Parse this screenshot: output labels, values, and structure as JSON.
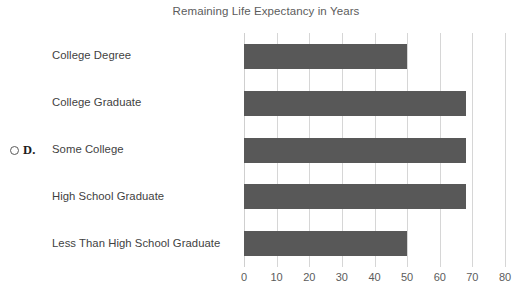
{
  "chart_data": {
    "type": "bar",
    "orientation": "horizontal",
    "title": "Remaining Life Expectancy in Years",
    "xlabel": "",
    "ylabel": "",
    "xlim": [
      0,
      80
    ],
    "xticks": [
      "0",
      "10",
      "20",
      "30",
      "40",
      "50",
      "60",
      "70",
      "80"
    ],
    "xtick_values": [
      0,
      10,
      20,
      30,
      40,
      50,
      60,
      70,
      80
    ],
    "grid": "vertical",
    "legend": "none",
    "bar_color": "#585858",
    "gridline_color": "#d6d6d6",
    "background_color": "#ffffff",
    "categories": [
      "College Degree",
      "College Graduate",
      "Some College",
      "High School Graduate",
      "Less Than High School Graduate"
    ],
    "values": [
      50,
      68,
      68,
      68,
      50
    ],
    "series": [
      {
        "name": "Remaining Life Expectancy in Years",
        "values": [
          50,
          68,
          68,
          68,
          50
        ]
      }
    ]
  },
  "question_option": {
    "letter": "D.",
    "radio_icon": "radio-circle-icon",
    "selected": false
  }
}
